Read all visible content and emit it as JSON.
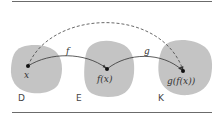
{
  "diagram": {
    "type": "function-composition",
    "colors": {
      "blob_fill": "#c4c4c4",
      "line": "#333333",
      "rule": "#6b6b6b"
    },
    "sets": [
      {
        "id": "D",
        "label": "D"
      },
      {
        "id": "E",
        "label": "E"
      },
      {
        "id": "K",
        "label": "K"
      }
    ],
    "points": [
      {
        "id": "x",
        "label": "x"
      },
      {
        "id": "fx",
        "label": "f(x)"
      },
      {
        "id": "gfx",
        "label": "g(f(x))"
      }
    ],
    "arrows": [
      {
        "from": "x",
        "to": "fx",
        "label": "f",
        "style": "solid"
      },
      {
        "from": "fx",
        "to": "gfx",
        "label": "g",
        "style": "solid"
      },
      {
        "from": "x",
        "to": "gfx",
        "label": "",
        "style": "dashed"
      }
    ]
  }
}
